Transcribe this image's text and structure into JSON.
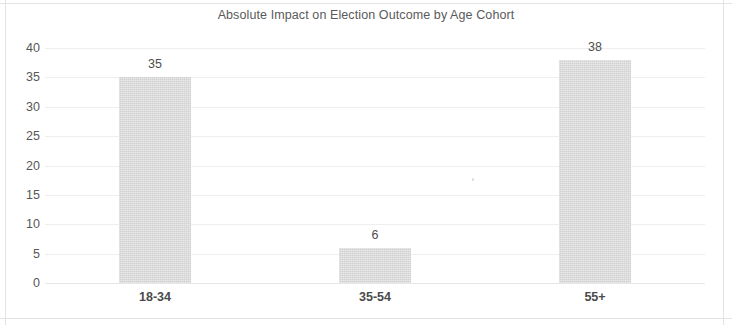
{
  "chart_data": {
    "type": "bar",
    "title": "Absolute Impact on Election Outcome by Age Cohort",
    "xlabel": "",
    "ylabel": "",
    "categories": [
      "18-34",
      "35-54",
      "55+"
    ],
    "values": [
      35,
      6,
      38
    ],
    "value_labels": [
      "35",
      "6",
      "38"
    ],
    "ylim": [
      0,
      40
    ],
    "ytick_labels": [
      "0",
      "5",
      "10",
      "15",
      "20",
      "25",
      "30",
      "35",
      "40"
    ],
    "ytick_values": [
      0,
      5,
      10,
      15,
      20,
      25,
      30,
      35,
      40
    ],
    "grid": true,
    "legend": false,
    "series": [
      {
        "name": "Absolute Impact",
        "values": [
          35,
          6,
          38
        ]
      }
    ],
    "colors": {
      "bar_fill": "#d2d2d2",
      "gridline": "#eeeeee",
      "title_text": "#5a5a5a",
      "axis_text": "#575757",
      "category_text": "#4a4a4a",
      "value_label_text": "#4d4d4d",
      "background": "#ffffff",
      "frame": "#e3e3e3"
    }
  }
}
